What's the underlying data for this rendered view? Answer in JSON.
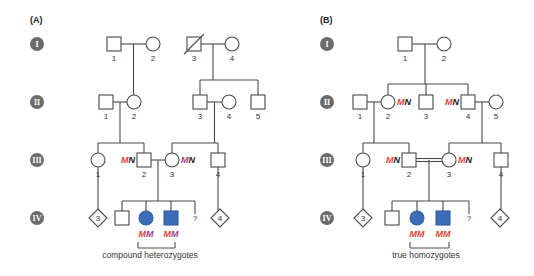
{
  "colors": {
    "red": "#e0433a",
    "purple": "#9b3f8a",
    "black": "#222222",
    "affected": "#3a6db5"
  },
  "generations": [
    "I",
    "II",
    "III",
    "IV"
  ],
  "gen_y": [
    44,
    102,
    160,
    218
  ],
  "panels": [
    {
      "label": "(A)",
      "label_x": 30,
      "caption": "compound heterozygotes",
      "caption_x": 150,
      "bracket": [
        138,
        175
      ],
      "individuals": [
        {
          "id": "I-1",
          "shape": "square",
          "x": 114,
          "gen": 0,
          "num": "1"
        },
        {
          "id": "I-2",
          "shape": "circle",
          "x": 153,
          "gen": 0,
          "num": "2"
        },
        {
          "id": "I-3",
          "shape": "square",
          "x": 194,
          "gen": 0,
          "num": "3",
          "deceased": true
        },
        {
          "id": "I-4",
          "shape": "circle",
          "x": 232,
          "gen": 0,
          "num": "4"
        },
        {
          "id": "II-1",
          "shape": "square",
          "x": 106,
          "gen": 1,
          "num": "1"
        },
        {
          "id": "II-2",
          "shape": "circle",
          "x": 134,
          "gen": 1,
          "num": "2"
        },
        {
          "id": "II-3",
          "shape": "square",
          "x": 200,
          "gen": 1,
          "num": "3"
        },
        {
          "id": "II-4",
          "shape": "circle",
          "x": 229,
          "gen": 1,
          "num": "4"
        },
        {
          "id": "II-5",
          "shape": "square",
          "x": 258,
          "gen": 1,
          "num": "5"
        },
        {
          "id": "III-1",
          "shape": "circle",
          "x": 98,
          "gen": 2,
          "num": "1"
        },
        {
          "id": "III-2",
          "shape": "square",
          "x": 144,
          "gen": 2,
          "num": "2",
          "geno": [
            {
              "t": "M",
              "c": "red"
            },
            {
              "t": "N",
              "c": "black"
            }
          ],
          "geno_side": "left"
        },
        {
          "id": "III-3",
          "shape": "circle",
          "x": 172,
          "gen": 2,
          "num": "3",
          "geno": [
            {
              "t": "M",
              "c": "purple"
            },
            {
              "t": "N",
              "c": "black"
            }
          ],
          "geno_side": "right"
        },
        {
          "id": "III-4",
          "shape": "square",
          "x": 218,
          "gen": 2,
          "num": "4"
        },
        {
          "id": "IV-d3",
          "shape": "diamond",
          "x": 98,
          "gen": 3,
          "text": "3"
        },
        {
          "id": "IV-1",
          "shape": "square",
          "x": 122,
          "gen": 3
        },
        {
          "id": "IV-2",
          "shape": "circle",
          "x": 146,
          "gen": 3,
          "affected": true,
          "geno": [
            {
              "t": "M",
              "c": "red"
            },
            {
              "t": "M",
              "c": "purple"
            }
          ],
          "geno_side": "below"
        },
        {
          "id": "IV-3",
          "shape": "square",
          "x": 171,
          "gen": 3,
          "affected": true,
          "geno": [
            {
              "t": "M",
              "c": "red"
            },
            {
              "t": "M",
              "c": "purple"
            }
          ],
          "geno_side": "below"
        },
        {
          "id": "IV-q",
          "shape": "unknown",
          "x": 195,
          "gen": 3,
          "text": "?"
        },
        {
          "id": "IV-d4",
          "shape": "diamond",
          "x": 220,
          "gen": 3,
          "text": "4"
        }
      ],
      "couples": [
        {
          "a": "I-1",
          "b": "I-2",
          "double": false,
          "drop": 133.5
        },
        {
          "a": "I-3",
          "b": "I-4",
          "double": false,
          "drop": 213
        },
        {
          "a": "II-1",
          "b": "II-2",
          "double": false,
          "drop": 120
        },
        {
          "a": "II-3",
          "b": "II-4",
          "double": false,
          "drop": 214.5
        },
        {
          "a": "III-2",
          "b": "III-3",
          "double": false,
          "drop": 158
        }
      ],
      "sibships": [
        {
          "from_x": 133.5,
          "from_y": 44,
          "bar_y": 94,
          "children": [
            134
          ],
          "single": true
        },
        {
          "from_x": 213,
          "from_y": 44,
          "bar_y": 80,
          "children": [
            200,
            258
          ]
        },
        {
          "from_x": 120,
          "from_y": 102,
          "bar_y": 143,
          "children": [
            98,
            144
          ]
        },
        {
          "from_x": 214.5,
          "from_y": 102,
          "bar_y": 143,
          "children": [
            172,
            218
          ]
        },
        {
          "from_x": 158,
          "from_y": 160,
          "bar_y": 201,
          "children": [
            122,
            146,
            171,
            195
          ]
        }
      ],
      "lines": [
        {
          "x1": 98,
          "y1": 167,
          "x2": 98,
          "y2": 211
        },
        {
          "x1": 218,
          "y1": 167,
          "x2": 218,
          "y2": 211
        }
      ]
    },
    {
      "label": "(B)",
      "label_x": 320,
      "caption": "true homozygotes",
      "caption_x": 426,
      "bracket": [
        410,
        449
      ],
      "individuals": [
        {
          "id": "I-1",
          "shape": "square",
          "x": 405,
          "gen": 0,
          "num": "1"
        },
        {
          "id": "I-2",
          "shape": "circle",
          "x": 444,
          "gen": 0,
          "num": "2"
        },
        {
          "id": "II-1",
          "shape": "square",
          "x": 360,
          "gen": 1,
          "num": "1"
        },
        {
          "id": "II-2",
          "shape": "circle",
          "x": 388,
          "gen": 1,
          "num": "2",
          "geno": [
            {
              "t": "M",
              "c": "red"
            },
            {
              "t": "N",
              "c": "black"
            }
          ],
          "geno_side": "right"
        },
        {
          "id": "II-3",
          "shape": "square",
          "x": 426,
          "gen": 1,
          "num": "3"
        },
        {
          "id": "II-4",
          "shape": "square",
          "x": 468,
          "gen": 1,
          "num": "4",
          "geno": [
            {
              "t": "M",
              "c": "red"
            },
            {
              "t": "N",
              "c": "black"
            }
          ],
          "geno_side": "left"
        },
        {
          "id": "II-5",
          "shape": "circle",
          "x": 496,
          "gen": 1,
          "num": "5"
        },
        {
          "id": "III-1",
          "shape": "circle",
          "x": 363,
          "gen": 2,
          "num": "1"
        },
        {
          "id": "III-2",
          "shape": "square",
          "x": 409,
          "gen": 2,
          "num": "2",
          "geno": [
            {
              "t": "M",
              "c": "red"
            },
            {
              "t": "N",
              "c": "black"
            }
          ],
          "geno_side": "left"
        },
        {
          "id": "III-3",
          "shape": "circle",
          "x": 449,
          "gen": 2,
          "num": "3",
          "geno": [
            {
              "t": "M",
              "c": "red"
            },
            {
              "t": "N",
              "c": "black"
            }
          ],
          "geno_side": "right"
        },
        {
          "id": "III-4",
          "shape": "square",
          "x": 501,
          "gen": 2,
          "num": "4"
        },
        {
          "id": "IV-d3",
          "shape": "diamond",
          "x": 363,
          "gen": 3,
          "text": "3"
        },
        {
          "id": "IV-1",
          "shape": "square",
          "x": 392,
          "gen": 3
        },
        {
          "id": "IV-2",
          "shape": "circle",
          "x": 417,
          "gen": 3,
          "affected": true,
          "geno": [
            {
              "t": "M",
              "c": "red"
            },
            {
              "t": "M",
              "c": "red"
            }
          ],
          "geno_side": "below"
        },
        {
          "id": "IV-3",
          "shape": "square",
          "x": 443,
          "gen": 3,
          "affected": true,
          "geno": [
            {
              "t": "M",
              "c": "red"
            },
            {
              "t": "M",
              "c": "red"
            }
          ],
          "geno_side": "below"
        },
        {
          "id": "IV-q",
          "shape": "unknown",
          "x": 469,
          "gen": 3,
          "text": "?"
        },
        {
          "id": "IV-d4",
          "shape": "diamond",
          "x": 500,
          "gen": 3,
          "text": "4"
        }
      ],
      "couples": [
        {
          "a": "I-1",
          "b": "I-2",
          "double": false,
          "drop": 425
        },
        {
          "a": "II-1",
          "b": "II-2",
          "double": false,
          "drop": 374
        },
        {
          "a": "II-4",
          "b": "II-5",
          "double": false,
          "drop": 482
        },
        {
          "a": "III-2",
          "b": "III-3",
          "double": true,
          "drop": 429
        }
      ],
      "sibships": [
        {
          "from_x": 425,
          "from_y": 44,
          "bar_y": 84,
          "children": [
            388,
            426,
            468
          ]
        },
        {
          "from_x": 374,
          "from_y": 102,
          "bar_y": 143,
          "children": [
            363,
            409
          ]
        },
        {
          "from_x": 482,
          "from_y": 102,
          "bar_y": 143,
          "children": [
            449,
            501
          ]
        },
        {
          "from_x": 429,
          "from_y": 160,
          "bar_y": 201,
          "children": [
            392,
            417,
            443,
            469
          ]
        }
      ],
      "lines": [
        {
          "x1": 363,
          "y1": 167,
          "x2": 363,
          "y2": 211
        },
        {
          "x1": 501,
          "y1": 167,
          "x2": 501,
          "y2": 211
        }
      ]
    }
  ]
}
